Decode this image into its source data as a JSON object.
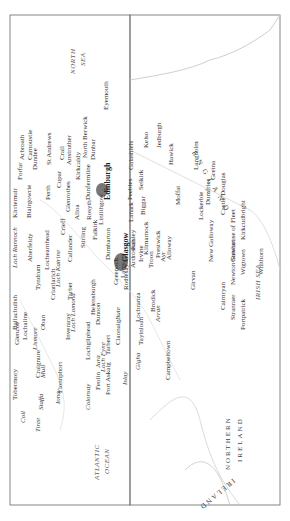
{
  "page": {
    "number": ""
  },
  "map": {
    "title": "Scotland (rotated)",
    "colors": {
      "border": "#555555",
      "coast": "#c8c8c8",
      "city": "#777777",
      "dot": "#aaaaaa"
    },
    "seas": {
      "north_sea_1": "NORTH",
      "north_sea_2": "SEA",
      "atlantic_1": "ATLANTIC",
      "atlantic_2": "OCEAN",
      "irish_sea": "IRISH SEA"
    },
    "countries": {
      "england": "E N G L A N D",
      "northern_ireland_1": "NORTHERN",
      "northern_ireland_2": "IRELAND",
      "ireland": "IRELAND"
    },
    "cities": {
      "edinburgh": "Edinburgh",
      "glasgow": "Glasgow"
    },
    "places": [
      "Eyemouth",
      "Arbroath",
      "Carnoustie",
      "Forfar",
      "Kirriemuir",
      "Dundee",
      "St Andrews",
      "Crail",
      "Anstruther",
      "Blairgowrie",
      "Perth",
      "Cupar",
      "Kirkcaldy",
      "North Berwick",
      "Dunbar",
      "Dunfermline",
      "Rosyth",
      "Glenrothes",
      "Alloa",
      "Crieff",
      "Linlithgow",
      "Falkirk",
      "Stirling",
      "Callander",
      "Aberfeldy",
      "Lochearnhead",
      "Tyndrum",
      "Crianlarich",
      "Tarbet",
      "Dumbarton",
      "Paisley",
      "Greenock",
      "Largs",
      "Rothesay",
      "Ardrossan",
      "Irvine",
      "Kilmarnock",
      "Troon",
      "Prestwick",
      "Ayr",
      "Alloway",
      "Lanark",
      "Biggar",
      "Peebles",
      "Galashiels",
      "Selkirk",
      "Kelso",
      "Jedburgh",
      "Hawick",
      "Langholm",
      "Moffat",
      "Lockerbie",
      "Dumfries",
      "Gretna",
      "Castle Douglas",
      "Kirkcudbright",
      "Gatehouse of Fleet",
      "New Galloway",
      "Newton Stewart",
      "Wigtown",
      "Whithorn",
      "Girvan",
      "Cairnryan",
      "Stranraer",
      "Portpatrick",
      "Glencoe",
      "Ballachulish",
      "Lochaline",
      "Oban",
      "Inveraray",
      "Helensburgh",
      "Dunoon",
      "Lochgilphead",
      "Tarbert",
      "Claonaig",
      "Lochranza",
      "Brodick",
      "Tayinloan",
      "Campbeltown",
      "Feolin",
      "Port Askaig",
      "Fionnphort",
      "Craignure",
      "Tobermory"
    ],
    "water_features": [
      "Loch Rannoch",
      "Loch Katrine",
      "Loch Lomond",
      "Loch Fyne",
      "Lismore",
      "Mull",
      "Staffa",
      "Iona",
      "Coll",
      "Tiree",
      "Jura",
      "Islay",
      "Colonsay",
      "Gigha",
      "Bute",
      "Arran"
    ]
  }
}
